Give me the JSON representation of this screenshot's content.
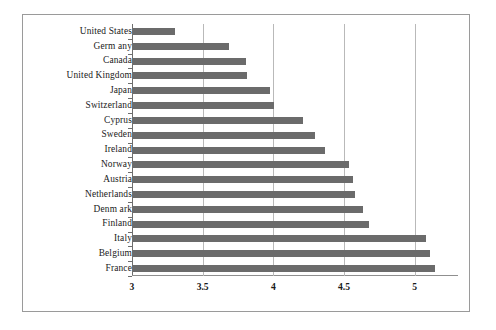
{
  "chart_data": {
    "type": "bar",
    "orientation": "horizontal",
    "title": "",
    "subtitle": "",
    "xlabel": "",
    "ylabel": "",
    "xlim": [
      3,
      5.25
    ],
    "ylim": null,
    "grid": true,
    "gridlines_axis": "x",
    "legend": null,
    "legend_position": "none",
    "bar_color": "#6b6b6b",
    "axis_color": "#6e6e6e",
    "gridline_color": "#b9b9b9",
    "border_color": "#9a9a9a",
    "xticks": [
      "3",
      "3.5",
      "4",
      "4.5",
      "5"
    ],
    "xtick_values": [
      3,
      3.5,
      4,
      4.5,
      5
    ],
    "categories": [
      "United States",
      "Germ any",
      "Canada",
      "United Kingdom",
      "Japan",
      "Switzerland",
      "Cyprus",
      "Sweden",
      "Ireland",
      "Norway",
      "Austria",
      "Netherlands",
      "Denm ark",
      "Finland",
      "Italy",
      "Belgium",
      "France"
    ],
    "values": [
      3.3,
      3.68,
      3.8,
      3.81,
      3.97,
      4.0,
      4.2,
      4.29,
      4.36,
      4.53,
      4.56,
      4.57,
      4.63,
      4.67,
      5.07,
      5.1,
      5.14
    ]
  }
}
